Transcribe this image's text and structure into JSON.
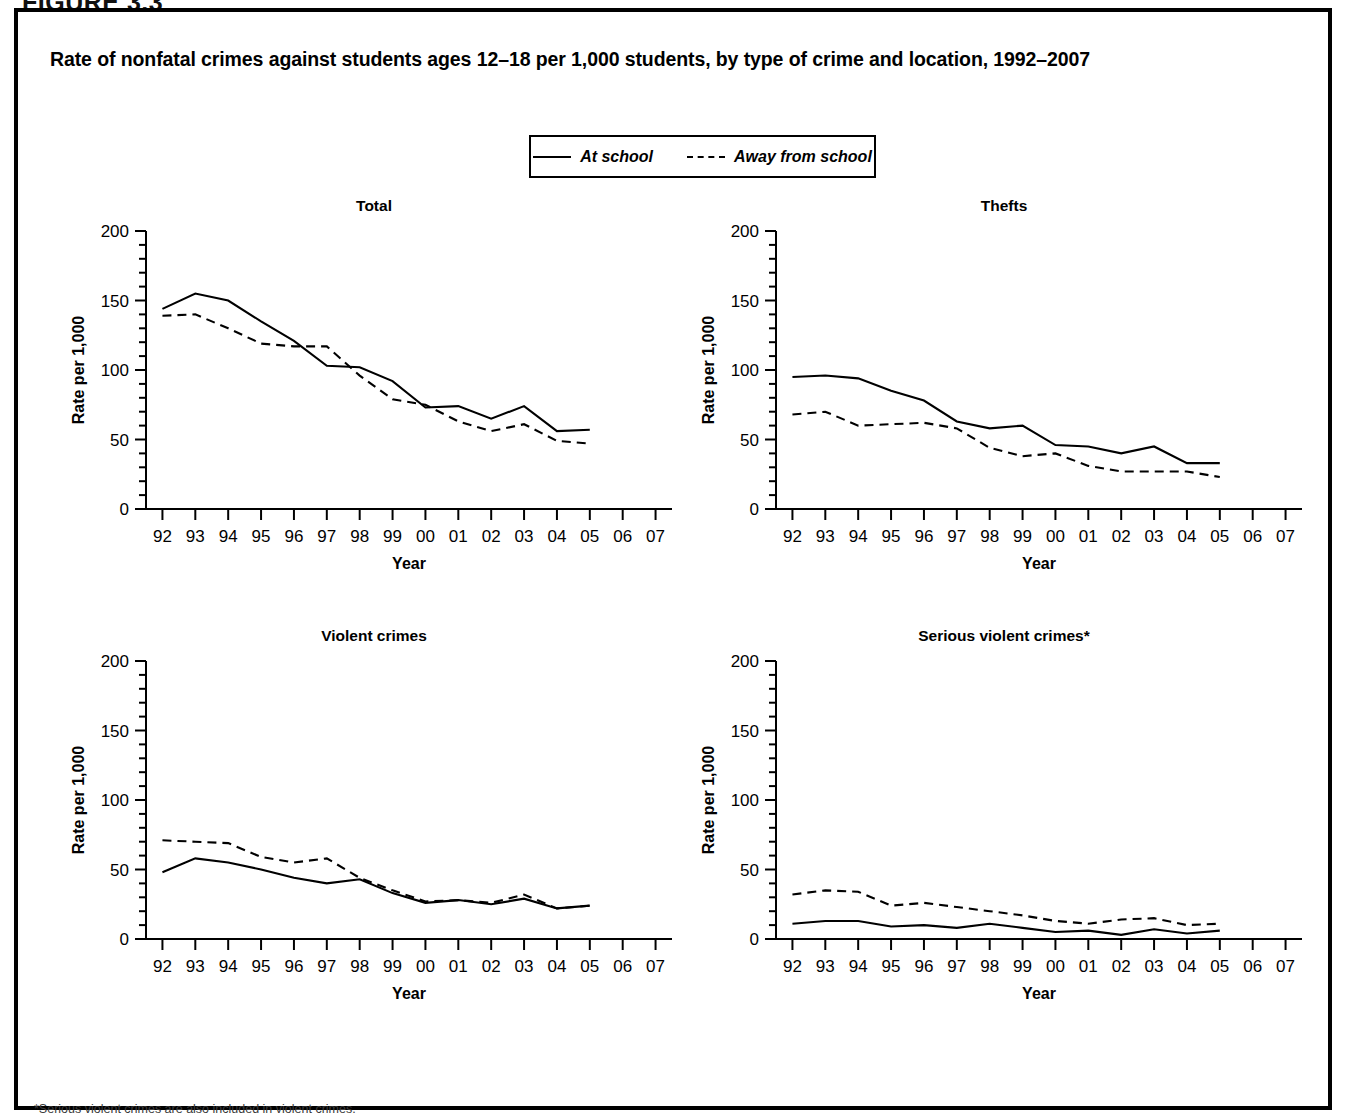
{
  "figure_label": "FIGURE 3.3",
  "title": "Rate of nonfatal crimes against students ages 12–18 per 1,000 students, by type of crime and location, 1992–2007",
  "legend": {
    "items": [
      {
        "label": "At school",
        "style": "solid"
      },
      {
        "label": "Away from school",
        "style": "dashed"
      }
    ]
  },
  "footnote": "*Serious violent crimes are also included in violent crimes.",
  "axis": {
    "ylabel": "Rate per 1,000",
    "xlabel": "Year",
    "yticks": [
      "0",
      "50",
      "100",
      "150",
      "200"
    ],
    "xticks": [
      "92",
      "93",
      "94",
      "95",
      "96",
      "97",
      "98",
      "99",
      "00",
      "01",
      "02",
      "03",
      "04",
      "05",
      "06",
      "07"
    ]
  },
  "chart_data": [
    {
      "type": "line",
      "title": "Total",
      "xlabel": "Year",
      "ylabel": "Rate per 1,000",
      "ylim": [
        0,
        200
      ],
      "grid": false,
      "legend_position": "top-center-shared",
      "categories": [
        "92",
        "93",
        "94",
        "95",
        "96",
        "97",
        "98",
        "99",
        "00",
        "01",
        "02",
        "03",
        "04",
        "05",
        "06",
        "07"
      ],
      "x": [
        1992,
        1993,
        1994,
        1995,
        1996,
        1997,
        1998,
        1999,
        2000,
        2001,
        2002,
        2003,
        2004,
        2005
      ],
      "series": [
        {
          "name": "At school",
          "style": "solid",
          "values": [
            144,
            155,
            150,
            135,
            121,
            103,
            102,
            92,
            73,
            74,
            65,
            74,
            56,
            57
          ]
        },
        {
          "name": "Away from school",
          "style": "dashed",
          "values": [
            139,
            140,
            130,
            119,
            117,
            117,
            96,
            79,
            75,
            63,
            56,
            61,
            49,
            47
          ]
        }
      ]
    },
    {
      "type": "line",
      "title": "Thefts",
      "xlabel": "Year",
      "ylabel": "Rate per 1,000",
      "ylim": [
        0,
        200
      ],
      "grid": false,
      "legend_position": "top-center-shared",
      "categories": [
        "92",
        "93",
        "94",
        "95",
        "96",
        "97",
        "98",
        "99",
        "00",
        "01",
        "02",
        "03",
        "04",
        "05",
        "06",
        "07"
      ],
      "x": [
        1992,
        1993,
        1994,
        1995,
        1996,
        1997,
        1998,
        1999,
        2000,
        2001,
        2002,
        2003,
        2004,
        2005
      ],
      "series": [
        {
          "name": "At school",
          "style": "solid",
          "values": [
            95,
            96,
            94,
            85,
            78,
            63,
            58,
            60,
            46,
            45,
            40,
            45,
            33,
            33
          ]
        },
        {
          "name": "Away from school",
          "style": "dashed",
          "values": [
            68,
            70,
            60,
            61,
            62,
            58,
            44,
            38,
            40,
            31,
            27,
            27,
            27,
            23
          ]
        }
      ]
    },
    {
      "type": "line",
      "title": "Violent crimes",
      "xlabel": "Year",
      "ylabel": "Rate per 1,000",
      "ylim": [
        0,
        200
      ],
      "grid": false,
      "legend_position": "top-center-shared",
      "categories": [
        "92",
        "93",
        "94",
        "95",
        "96",
        "97",
        "98",
        "99",
        "00",
        "01",
        "02",
        "03",
        "04",
        "05",
        "06",
        "07"
      ],
      "x": [
        1992,
        1993,
        1994,
        1995,
        1996,
        1997,
        1998,
        1999,
        2000,
        2001,
        2002,
        2003,
        2004,
        2005
      ],
      "series": [
        {
          "name": "At school",
          "style": "solid",
          "values": [
            48,
            58,
            55,
            50,
            44,
            40,
            43,
            33,
            26,
            28,
            25,
            29,
            22,
            24
          ]
        },
        {
          "name": "Away from school",
          "style": "dashed",
          "values": [
            71,
            70,
            69,
            59,
            55,
            58,
            44,
            35,
            27,
            28,
            26,
            32,
            22,
            24
          ]
        }
      ]
    },
    {
      "type": "line",
      "title": "Serious violent crimes*",
      "xlabel": "Year",
      "ylabel": "Rate per 1,000",
      "ylim": [
        0,
        200
      ],
      "grid": false,
      "legend_position": "top-center-shared",
      "categories": [
        "92",
        "93",
        "94",
        "95",
        "96",
        "97",
        "98",
        "99",
        "00",
        "01",
        "02",
        "03",
        "04",
        "05",
        "06",
        "07"
      ],
      "x": [
        1992,
        1993,
        1994,
        1995,
        1996,
        1997,
        1998,
        1999,
        2000,
        2001,
        2002,
        2003,
        2004,
        2005
      ],
      "series": [
        {
          "name": "At school",
          "style": "solid",
          "values": [
            11,
            13,
            13,
            9,
            10,
            8,
            11,
            8,
            5,
            6,
            3,
            7,
            4,
            6
          ]
        },
        {
          "name": "Away from school",
          "style": "dashed",
          "values": [
            32,
            35,
            34,
            24,
            26,
            23,
            20,
            17,
            13,
            11,
            14,
            15,
            10,
            11
          ]
        }
      ]
    }
  ]
}
